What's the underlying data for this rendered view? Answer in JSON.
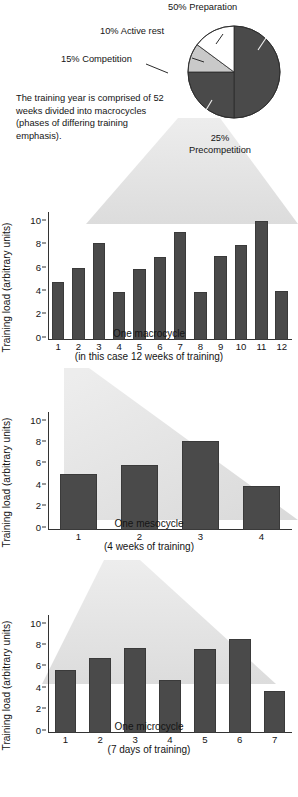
{
  "figure": {
    "caption_note": "The training year is comprised of 52 weeks divided into macrocycles (phases of differing training emphasis)."
  },
  "colors": {
    "bar_fill": "#4a4a4a",
    "pie_dark": "#4a4a4a",
    "pie_light_gray": "#c9c9c9",
    "pie_white": "#ffffff",
    "funnel": "#e0e0e0",
    "axis": "#333333",
    "text": "#141414"
  },
  "chart_data": [
    {
      "type": "pie",
      "title": "",
      "legend_position": "callout-labels",
      "slices": [
        {
          "label": "50% Preparation",
          "name": "Preparation",
          "value": 50,
          "color": "#4a4a4a"
        },
        {
          "label": "25% Precompetition",
          "name": "Precompetition",
          "value": 25,
          "color": "#4a4a4a"
        },
        {
          "label": "15% Competition",
          "name": "Competition",
          "value": 15,
          "color": "#c9c9c9"
        },
        {
          "label": "10% Active rest",
          "name": "Active rest",
          "value": 10,
          "color": "#ffffff"
        }
      ]
    },
    {
      "type": "bar",
      "title": "",
      "xlabel": "One macrocycle\n(in this case 12 weeks of training)",
      "xlabel_line1": "One macrocycle",
      "xlabel_line2": "(in this case 12 weeks of training)",
      "ylabel": "Training load (arbitrary units)",
      "ylim": [
        0,
        11
      ],
      "yticks": [
        0,
        2,
        4,
        6,
        8,
        10
      ],
      "grid": false,
      "categories": [
        "1",
        "2",
        "3",
        "4",
        "5",
        "6",
        "7",
        "8",
        "9",
        "10",
        "11",
        "12"
      ],
      "values": [
        5.0,
        6.2,
        8.3,
        4.1,
        6.1,
        7.1,
        9.3,
        4.1,
        7.2,
        8.2,
        10.2,
        4.2
      ]
    },
    {
      "type": "bar",
      "title": "",
      "xlabel": "One mesocycle\n(4 weeks of training)",
      "xlabel_line1": "One mesocycle",
      "xlabel_line2": "(4 weeks of training)",
      "ylabel": "Training load (arbitrary units)",
      "ylim": [
        0,
        11
      ],
      "yticks": [
        0,
        2,
        4,
        6,
        8,
        10
      ],
      "grid": false,
      "categories": [
        "1",
        "2",
        "3",
        "4"
      ],
      "values": [
        5.2,
        6.1,
        8.3,
        4.1
      ]
    },
    {
      "type": "bar",
      "title": "",
      "xlabel": "One microcycle\n(7 days of training)",
      "xlabel_line1": "One microcycle",
      "xlabel_line2": "(7 days of training)",
      "ylabel": "Training load (arbitrary units)",
      "ylim": [
        0,
        11
      ],
      "yticks": [
        0,
        2,
        4,
        6,
        8,
        10
      ],
      "grid": false,
      "categories": [
        "1",
        "2",
        "3",
        "4",
        "5",
        "6",
        "7"
      ],
      "values": [
        5.9,
        7.0,
        7.9,
        4.9,
        7.8,
        8.8,
        3.9
      ]
    }
  ]
}
